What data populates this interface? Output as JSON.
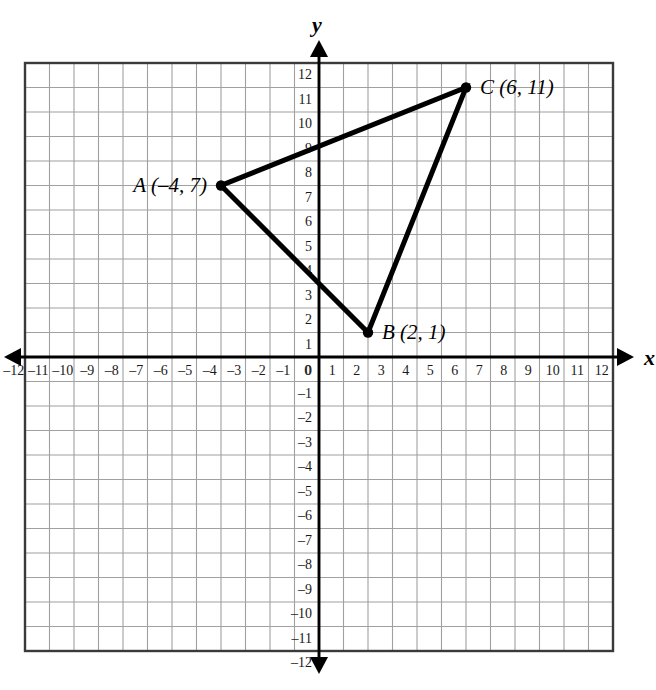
{
  "figure": {
    "kind": "coordinate-plane-triangle",
    "background_color": "#ffffff",
    "grid_color": "#a0a0a0",
    "grid_border_color": "#3a3a3a",
    "axis_color": "#000000",
    "shape_color": "#000000"
  },
  "axes": {
    "x_axis_name": "x",
    "y_axis_name": "y",
    "x_min": -12,
    "x_max": 12,
    "y_min": -12,
    "y_max": 12,
    "step": 1,
    "origin_label": "0",
    "x_tick_labels": [
      "–12",
      "–11",
      "–10",
      "–9",
      "–8",
      "–7",
      "–6",
      "–5",
      "–4",
      "–3",
      "–2",
      "–1",
      "0",
      "1",
      "2",
      "3",
      "4",
      "5",
      "6",
      "7",
      "8",
      "9",
      "10",
      "11",
      "12"
    ],
    "y_tick_labels": [
      "–12",
      "–11",
      "–10",
      "–9",
      "–8",
      "–7",
      "–6",
      "–5",
      "–4",
      "–3",
      "–2",
      "–1",
      "1",
      "2",
      "3",
      "4",
      "5",
      "6",
      "7",
      "8",
      "9",
      "10",
      "11",
      "12"
    ]
  },
  "chart_data": {
    "type": "scatter",
    "title": "",
    "xlabel": "x",
    "ylabel": "y",
    "xlim": [
      -12,
      12
    ],
    "ylim": [
      -12,
      12
    ],
    "grid": true,
    "legend": "none",
    "series": [
      {
        "name": "Triangle ABC",
        "shape": "polygon",
        "closed": true,
        "points": [
          {
            "vertex": "A",
            "x": -4,
            "y": 7,
            "label": "A (–4, 7)",
            "label_position": "left"
          },
          {
            "vertex": "B",
            "x": 2,
            "y": 1,
            "label": "B (2, 1)",
            "label_position": "right"
          },
          {
            "vertex": "C",
            "x": 6,
            "y": 11,
            "label": "C (6, 11)",
            "label_position": "right"
          }
        ]
      }
    ]
  },
  "vertex_labels": {
    "a": "A (–4, 7)",
    "b": "B (2, 1)",
    "c": "C (6, 11)"
  }
}
